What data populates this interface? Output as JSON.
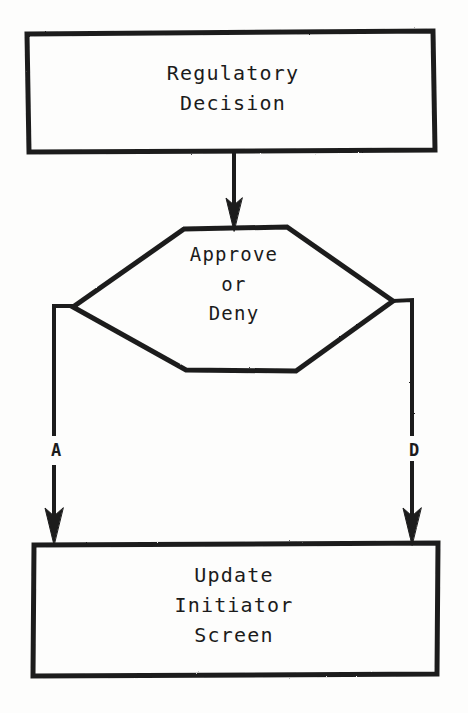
{
  "diagram": {
    "style": "typewritten hand-drawn flowchart, black ink on white paper",
    "ink_color": "#1b1b1b",
    "paper_color": "#fdfdfc",
    "nodes": [
      {
        "id": "process-start",
        "shape": "rectangle",
        "label": "Regulatory\nDecision",
        "lines": [
          "Regulatory",
          "Decision"
        ]
      },
      {
        "id": "decision",
        "shape": "hexagon",
        "label": "Approve\nor\nDeny",
        "lines": [
          "Approve",
          "or",
          "Deny"
        ]
      },
      {
        "id": "process-end",
        "shape": "rectangle",
        "label": "Update\nInitiator\nScreen",
        "lines": [
          "Update",
          "Initiator",
          "Screen"
        ]
      }
    ],
    "edges": [
      {
        "id": "edge-start-to-decision",
        "from": "process-start",
        "to": "decision",
        "label": ""
      },
      {
        "id": "edge-decision-approve",
        "from": "decision",
        "to": "process-end",
        "label": "A"
      },
      {
        "id": "edge-decision-deny",
        "from": "decision",
        "to": "process-end",
        "label": "D"
      }
    ],
    "branch_labels": {
      "approve": "A",
      "deny": "D"
    }
  }
}
